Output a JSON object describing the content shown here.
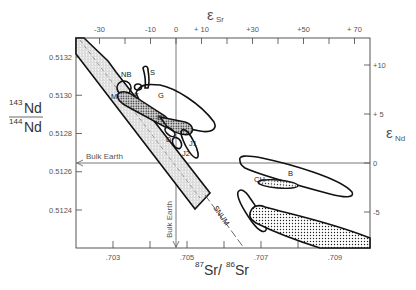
{
  "chart_data": {
    "type": "scatter",
    "title": "",
    "xlabel": "87Sr/86Sr",
    "ylabel": "143Nd/144Nd",
    "x_top_label": "εSr",
    "y_right_label": "εNd",
    "xlim": [
      0.702,
      0.71
    ],
    "ylim": [
      0.51218,
      0.51334
    ],
    "x_ticks": [
      {
        "value": 0.703,
        "label": ".703"
      },
      {
        "value": 0.704,
        "label": ""
      },
      {
        "value": 0.705,
        "label": ".705"
      },
      {
        "value": 0.706,
        "label": ""
      },
      {
        "value": 0.707,
        "label": ".707"
      },
      {
        "value": 0.708,
        "label": ""
      },
      {
        "value": 0.709,
        "label": ".709"
      }
    ],
    "y_ticks": [
      {
        "value": 0.5132,
        "label": "0.5132"
      },
      {
        "value": 0.513,
        "label": "0.5130"
      },
      {
        "value": 0.5128,
        "label": "0.5128"
      },
      {
        "value": 0.5126,
        "label": "0.5126"
      },
      {
        "value": 0.5124,
        "label": "0.5124"
      }
    ],
    "top_ticks": [
      {
        "value": -30,
        "label": "-30"
      },
      {
        "value": -20,
        "label": ""
      },
      {
        "value": -10,
        "label": "-10"
      },
      {
        "value": 0,
        "label": "0"
      },
      {
        "value": 10,
        "label": "+ 10"
      },
      {
        "value": 20,
        "label": ""
      },
      {
        "value": 30,
        "label": "+30"
      },
      {
        "value": 40,
        "label": ""
      },
      {
        "value": 50,
        "label": "+50"
      },
      {
        "value": 60,
        "label": ""
      },
      {
        "value": 70,
        "label": "+ 70"
      }
    ],
    "right_ticks": [
      {
        "value": 10,
        "label": "+10"
      },
      {
        "value": 5,
        "label": "+ 5"
      },
      {
        "value": 0,
        "label": "0"
      },
      {
        "value": -5,
        "label": "-5"
      }
    ],
    "reference_lines": {
      "bulk_earth_nd": {
        "value": 0.51264,
        "label": "Bulk Earth"
      },
      "bulk_earth_sr": {
        "value": 0.7045,
        "label": "Bulk Earth"
      }
    },
    "fields": [
      {
        "name": "mantle-array",
        "label": "",
        "fill": "hatched"
      },
      {
        "name": "NB",
        "label": "NB",
        "fill": "none"
      },
      {
        "name": "S",
        "label": "S",
        "fill": "none"
      },
      {
        "name": "G",
        "label": "G",
        "fill": "none"
      },
      {
        "name": "K",
        "label": "K",
        "fill": "none"
      },
      {
        "name": "M",
        "label": "M",
        "fill": "none"
      },
      {
        "name": "E",
        "label": "E",
        "fill": "dotted"
      },
      {
        "name": "D",
        "label": "D",
        "fill": "none"
      },
      {
        "name": "J1",
        "label": "J1",
        "fill": "none"
      },
      {
        "name": "J2",
        "label": "J2",
        "fill": "none"
      },
      {
        "name": "CH",
        "label": "CH",
        "fill": "none"
      },
      {
        "name": "B",
        "label": "B",
        "fill": "none"
      },
      {
        "name": "dotted-ellipse",
        "label": "",
        "fill": "dotted"
      },
      {
        "name": "dotted-band",
        "label": "",
        "fill": "dotted"
      }
    ],
    "annotations": [
      {
        "text": "SNUM",
        "type": "dashed-line-label"
      }
    ],
    "grid": false,
    "legend": "none"
  }
}
